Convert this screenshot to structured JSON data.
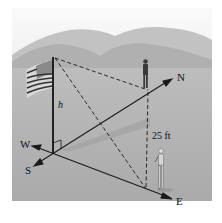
{
  "figure": {
    "labels": {
      "north": "N",
      "east": "E",
      "west": "W",
      "south": "S",
      "height": "h",
      "distance": "25 ft"
    }
  },
  "colors": {
    "background": "#ffffff",
    "sky": "#e6e6e6",
    "hills_far": "#b9b9b9",
    "hills_near": "#a8a8a8",
    "ground": "#b3b3b3",
    "line": "#1a1a1a"
  }
}
